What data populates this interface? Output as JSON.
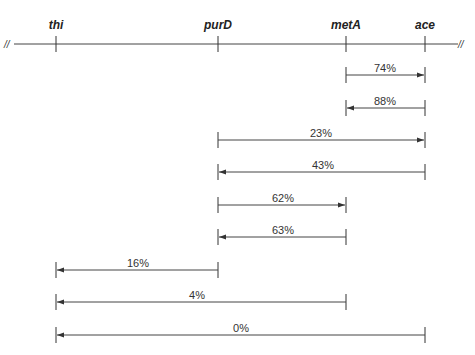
{
  "diagram": {
    "type": "genetic-map-cotransduction",
    "axis": {
      "break_left": "//",
      "break_right": "//",
      "genes": [
        {
          "name": "thi",
          "x": 56
        },
        {
          "name": "purD",
          "x": 218
        },
        {
          "name": "metA",
          "x": 346
        },
        {
          "name": "ace",
          "x": 425
        }
      ]
    },
    "arrows": [
      {
        "label": "74%",
        "from": "metA",
        "to": "ace",
        "direction": "right"
      },
      {
        "label": "88%",
        "from": "ace",
        "to": "metA",
        "direction": "left"
      },
      {
        "label": "23%",
        "from": "purD",
        "to": "ace",
        "direction": "right"
      },
      {
        "label": "43%",
        "from": "ace",
        "to": "purD",
        "direction": "left"
      },
      {
        "label": "62%",
        "from": "purD",
        "to": "metA",
        "direction": "right"
      },
      {
        "label": "63%",
        "from": "metA",
        "to": "purD",
        "direction": "left"
      },
      {
        "label": "16%",
        "from": "purD",
        "to": "thi",
        "direction": "left"
      },
      {
        "label": "4%",
        "from": "metA",
        "to": "thi",
        "direction": "left"
      },
      {
        "label": "0%",
        "from": "ace",
        "to": "thi",
        "direction": "left"
      }
    ]
  }
}
